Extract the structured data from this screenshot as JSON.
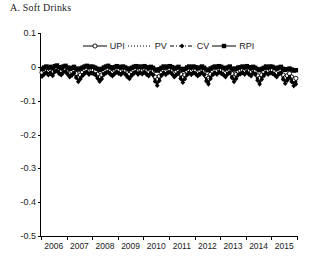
{
  "title": "A. Soft Drinks",
  "legend": [
    {
      "label": "UPI",
      "marker": "open-circle",
      "line": "solid"
    },
    {
      "label": "PV",
      "marker": "dot",
      "line": "dotted"
    },
    {
      "label": "CV",
      "marker": "diamond",
      "line": "dash-dot"
    },
    {
      "label": "RPI",
      "marker": "filled-square",
      "line": "solid"
    }
  ],
  "chart_data": {
    "type": "line",
    "title": "A. Soft Drinks",
    "xlabel": "",
    "ylabel": "",
    "ylim": [
      -0.5,
      0.1
    ],
    "yticks": [
      0.1,
      0,
      -0.1,
      -0.2,
      -0.3,
      -0.4,
      -0.5
    ],
    "ytick_labels": [
      "0.1",
      "0",
      "-0.1",
      "-0.2",
      "-0.3",
      "-0.4",
      "-0.5"
    ],
    "xlim": [
      2006,
      2016
    ],
    "xticks": [
      2006,
      2007,
      2008,
      2009,
      2010,
      2011,
      2012,
      2013,
      2014,
      2015,
      2016
    ],
    "xtick_labels": [
      "2006",
      "2007",
      "2008",
      "2009",
      "2010",
      "2011",
      "2012",
      "2013",
      "2014",
      "2015"
    ],
    "grid": false,
    "legend_position": "top-center",
    "frequency": "monthly",
    "x": [
      2006.0,
      2006.083,
      2006.167,
      2006.25,
      2006.333,
      2006.417,
      2006.5,
      2006.583,
      2006.667,
      2006.75,
      2006.833,
      2006.917,
      2007.0,
      2007.083,
      2007.167,
      2007.25,
      2007.333,
      2007.417,
      2007.5,
      2007.583,
      2007.667,
      2007.75,
      2007.833,
      2007.917,
      2008.0,
      2008.083,
      2008.167,
      2008.25,
      2008.333,
      2008.417,
      2008.5,
      2008.583,
      2008.667,
      2008.75,
      2008.833,
      2008.917,
      2009.0,
      2009.083,
      2009.167,
      2009.25,
      2009.333,
      2009.417,
      2009.5,
      2009.583,
      2009.667,
      2009.75,
      2009.833,
      2009.917,
      2010.0,
      2010.083,
      2010.167,
      2010.25,
      2010.333,
      2010.417,
      2010.5,
      2010.583,
      2010.667,
      2010.75,
      2010.833,
      2010.917,
      2011.0,
      2011.083,
      2011.167,
      2011.25,
      2011.333,
      2011.417,
      2011.5,
      2011.583,
      2011.667,
      2011.75,
      2011.833,
      2011.917,
      2012.0,
      2012.083,
      2012.167,
      2012.25,
      2012.333,
      2012.417,
      2012.5,
      2012.583,
      2012.667,
      2012.75,
      2012.833,
      2012.917,
      2013.0,
      2013.083,
      2013.167,
      2013.25,
      2013.333,
      2013.417,
      2013.5,
      2013.583,
      2013.667,
      2013.75,
      2013.833,
      2013.917,
      2014.0,
      2014.083,
      2014.167,
      2014.25,
      2014.333,
      2014.417,
      2014.5,
      2014.583,
      2014.667,
      2014.75,
      2014.833,
      2014.917,
      2015.0,
      2015.083,
      2015.167,
      2015.25,
      2015.333,
      2015.417,
      2015.5,
      2015.583,
      2015.667,
      2015.75,
      2015.833,
      2015.917
    ],
    "series": [
      {
        "name": "UPI",
        "marker": "open-circle",
        "line": "solid",
        "values": [
          -0.017,
          -0.01,
          -0.008,
          -0.012,
          -0.009,
          -0.015,
          -0.006,
          -0.004,
          -0.01,
          -0.013,
          -0.008,
          -0.006,
          -0.012,
          -0.018,
          -0.014,
          -0.009,
          -0.02,
          -0.03,
          -0.024,
          -0.016,
          -0.01,
          -0.008,
          -0.012,
          -0.009,
          -0.01,
          -0.014,
          -0.022,
          -0.03,
          -0.024,
          -0.013,
          -0.01,
          -0.008,
          -0.012,
          -0.016,
          -0.011,
          -0.008,
          -0.01,
          -0.013,
          -0.009,
          -0.012,
          -0.018,
          -0.022,
          -0.015,
          -0.01,
          -0.008,
          -0.012,
          -0.009,
          -0.011,
          -0.008,
          -0.012,
          -0.016,
          -0.01,
          -0.014,
          -0.03,
          -0.038,
          -0.028,
          -0.016,
          -0.01,
          -0.013,
          -0.009,
          -0.008,
          -0.012,
          -0.018,
          -0.014,
          -0.01,
          -0.022,
          -0.032,
          -0.024,
          -0.014,
          -0.01,
          -0.013,
          -0.009,
          -0.011,
          -0.016,
          -0.012,
          -0.009,
          -0.014,
          -0.028,
          -0.034,
          -0.022,
          -0.014,
          -0.01,
          -0.012,
          -0.008,
          -0.01,
          -0.014,
          -0.018,
          -0.012,
          -0.009,
          -0.02,
          -0.03,
          -0.022,
          -0.014,
          -0.011,
          -0.009,
          -0.012,
          -0.008,
          -0.012,
          -0.016,
          -0.01,
          -0.013,
          -0.026,
          -0.034,
          -0.024,
          -0.015,
          -0.01,
          -0.012,
          -0.009,
          -0.01,
          -0.014,
          -0.018,
          -0.012,
          -0.01,
          -0.024,
          -0.032,
          -0.026,
          -0.02,
          -0.03,
          -0.038,
          -0.034
        ]
      },
      {
        "name": "PV",
        "marker": "dot",
        "line": "dotted",
        "values": [
          -0.025,
          -0.018,
          -0.015,
          -0.02,
          -0.016,
          -0.022,
          -0.012,
          -0.01,
          -0.017,
          -0.02,
          -0.014,
          -0.012,
          -0.019,
          -0.026,
          -0.021,
          -0.016,
          -0.028,
          -0.038,
          -0.032,
          -0.023,
          -0.017,
          -0.014,
          -0.019,
          -0.016,
          -0.017,
          -0.021,
          -0.03,
          -0.038,
          -0.032,
          -0.02,
          -0.016,
          -0.014,
          -0.019,
          -0.023,
          -0.018,
          -0.014,
          -0.017,
          -0.02,
          -0.015,
          -0.019,
          -0.026,
          -0.03,
          -0.022,
          -0.017,
          -0.014,
          -0.019,
          -0.015,
          -0.018,
          -0.014,
          -0.019,
          -0.023,
          -0.016,
          -0.021,
          -0.038,
          -0.048,
          -0.036,
          -0.023,
          -0.016,
          -0.02,
          -0.015,
          -0.014,
          -0.019,
          -0.026,
          -0.021,
          -0.016,
          -0.03,
          -0.04,
          -0.032,
          -0.021,
          -0.016,
          -0.02,
          -0.015,
          -0.018,
          -0.023,
          -0.019,
          -0.015,
          -0.021,
          -0.036,
          -0.044,
          -0.03,
          -0.021,
          -0.016,
          -0.019,
          -0.014,
          -0.017,
          -0.021,
          -0.026,
          -0.019,
          -0.015,
          -0.028,
          -0.038,
          -0.03,
          -0.021,
          -0.018,
          -0.015,
          -0.019,
          -0.014,
          -0.019,
          -0.023,
          -0.016,
          -0.02,
          -0.034,
          -0.044,
          -0.032,
          -0.022,
          -0.016,
          -0.019,
          -0.015,
          -0.017,
          -0.021,
          -0.026,
          -0.019,
          -0.016,
          -0.032,
          -0.042,
          -0.034,
          -0.028,
          -0.038,
          -0.048,
          -0.044
        ]
      },
      {
        "name": "CV",
        "marker": "diamond",
        "line": "dash-dot",
        "values": [
          -0.028,
          -0.022,
          -0.018,
          -0.024,
          -0.02,
          -0.026,
          -0.015,
          -0.012,
          -0.02,
          -0.024,
          -0.017,
          -0.014,
          -0.022,
          -0.03,
          -0.025,
          -0.019,
          -0.032,
          -0.044,
          -0.036,
          -0.026,
          -0.02,
          -0.016,
          -0.022,
          -0.019,
          -0.02,
          -0.024,
          -0.034,
          -0.043,
          -0.036,
          -0.023,
          -0.019,
          -0.016,
          -0.022,
          -0.027,
          -0.021,
          -0.016,
          -0.02,
          -0.023,
          -0.018,
          -0.022,
          -0.03,
          -0.035,
          -0.026,
          -0.02,
          -0.016,
          -0.022,
          -0.018,
          -0.021,
          -0.016,
          -0.022,
          -0.027,
          -0.019,
          -0.024,
          -0.043,
          -0.055,
          -0.041,
          -0.026,
          -0.019,
          -0.023,
          -0.018,
          -0.016,
          -0.022,
          -0.03,
          -0.024,
          -0.019,
          -0.035,
          -0.046,
          -0.036,
          -0.024,
          -0.019,
          -0.023,
          -0.018,
          -0.021,
          -0.027,
          -0.022,
          -0.018,
          -0.024,
          -0.042,
          -0.051,
          -0.035,
          -0.024,
          -0.019,
          -0.022,
          -0.016,
          -0.02,
          -0.024,
          -0.03,
          -0.022,
          -0.018,
          -0.032,
          -0.044,
          -0.035,
          -0.024,
          -0.021,
          -0.018,
          -0.022,
          -0.016,
          -0.022,
          -0.027,
          -0.019,
          -0.023,
          -0.04,
          -0.051,
          -0.037,
          -0.026,
          -0.019,
          -0.022,
          -0.018,
          -0.02,
          -0.024,
          -0.03,
          -0.022,
          -0.019,
          -0.037,
          -0.049,
          -0.04,
          -0.032,
          -0.044,
          -0.056,
          -0.051
        ]
      },
      {
        "name": "RPI",
        "marker": "filled-square",
        "line": "solid",
        "values": [
          -0.006,
          -0.002,
          0.001,
          -0.003,
          0.0,
          -0.004,
          0.002,
          0.004,
          -0.001,
          -0.004,
          0.001,
          0.003,
          -0.002,
          -0.006,
          -0.003,
          0.0,
          -0.005,
          -0.008,
          -0.005,
          -0.002,
          0.001,
          0.003,
          -0.001,
          0.001,
          0.0,
          -0.003,
          -0.006,
          -0.009,
          -0.006,
          -0.002,
          0.001,
          0.003,
          -0.001,
          -0.004,
          -0.001,
          0.002,
          0.0,
          -0.002,
          0.001,
          -0.002,
          -0.005,
          -0.007,
          -0.003,
          0.0,
          0.002,
          -0.001,
          0.001,
          -0.001,
          0.002,
          -0.001,
          -0.004,
          0.0,
          -0.003,
          -0.008,
          -0.011,
          -0.007,
          -0.003,
          0.001,
          -0.002,
          0.001,
          0.002,
          -0.001,
          -0.005,
          -0.003,
          0.0,
          -0.006,
          -0.009,
          -0.006,
          -0.002,
          0.001,
          -0.002,
          0.001,
          -0.001,
          -0.004,
          -0.002,
          0.001,
          -0.003,
          -0.008,
          -0.01,
          -0.005,
          -0.002,
          0.001,
          -0.001,
          0.002,
          0.0,
          -0.003,
          -0.005,
          -0.002,
          0.001,
          -0.005,
          -0.008,
          -0.005,
          -0.002,
          -0.001,
          0.001,
          -0.002,
          0.002,
          -0.001,
          -0.004,
          0.0,
          -0.003,
          -0.007,
          -0.01,
          -0.006,
          -0.003,
          0.001,
          -0.002,
          0.001,
          0.0,
          -0.003,
          -0.005,
          -0.002,
          0.0,
          -0.006,
          -0.009,
          -0.007,
          -0.005,
          -0.008,
          -0.011,
          -0.01
        ]
      }
    ]
  }
}
